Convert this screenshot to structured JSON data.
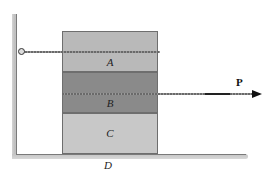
{
  "diagram": {
    "type": "statics-friction-blocks",
    "blocks": [
      {
        "id": "A",
        "label": "A",
        "fill": "#b9b9b9",
        "tethered_to": "wall"
      },
      {
        "id": "B",
        "label": "B",
        "fill": "#8a8a8a",
        "pulled_by": "P"
      },
      {
        "id": "C",
        "label": "C",
        "fill": "#c8c8c8"
      }
    ],
    "force": {
      "label": "P",
      "direction": "right",
      "applied_to": "B"
    },
    "surface": {
      "label": "D"
    },
    "wall": {
      "side": "left",
      "attachment": "pin"
    }
  }
}
